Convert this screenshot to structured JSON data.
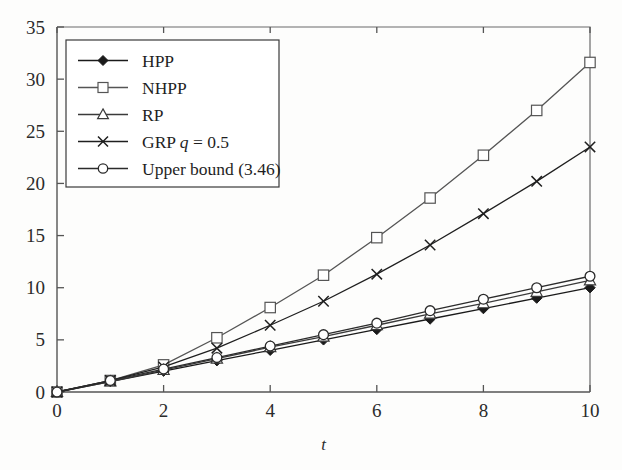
{
  "chart_data": {
    "type": "line",
    "title": "",
    "xlabel": "t",
    "ylabel": "",
    "xlim": [
      0,
      10
    ],
    "ylim": [
      0,
      35
    ],
    "xticks": [
      0,
      2,
      4,
      6,
      8,
      10
    ],
    "yticks": [
      0,
      5,
      10,
      15,
      20,
      25,
      30,
      35
    ],
    "xtick_labels": [
      "0",
      "2",
      "4",
      "6",
      "8",
      "10"
    ],
    "ytick_labels": [
      "0",
      "5",
      "10",
      "15",
      "20",
      "25",
      "30",
      "35"
    ],
    "grid": false,
    "legend_position": "upper left",
    "x": [
      0,
      1,
      2,
      3,
      4,
      5,
      6,
      7,
      8,
      9,
      10
    ],
    "series": [
      {
        "name": "HPP",
        "label": "HPP",
        "marker": "filled-diamond",
        "color": "#1a1a1a",
        "values": [
          0,
          1.0,
          2.0,
          3.0,
          4.0,
          5.0,
          6.0,
          7.0,
          8.0,
          9.0,
          10.0
        ]
      },
      {
        "name": "NHPP",
        "label": "NHPP",
        "marker": "open-square",
        "color": "#555555",
        "values": [
          0,
          1.1,
          2.6,
          5.2,
          8.1,
          11.2,
          14.8,
          18.6,
          22.7,
          27.0,
          31.6
        ]
      },
      {
        "name": "RP",
        "label": "RP",
        "marker": "open-triangle",
        "color": "#3a3a3a",
        "values": [
          0,
          1.0,
          2.1,
          3.2,
          4.3,
          5.3,
          6.4,
          7.5,
          8.5,
          9.6,
          10.7
        ]
      },
      {
        "name": "GRP q = 0.5",
        "label_prefix": "GRP ",
        "label_italic": "q",
        "label_suffix": " = 0.5",
        "marker": "x-cross",
        "color": "#1f1f1f",
        "values": [
          0,
          1.1,
          2.4,
          4.2,
          6.4,
          8.7,
          11.3,
          14.1,
          17.1,
          20.2,
          23.5
        ]
      },
      {
        "name": "Upper bound (3.46)",
        "label": "Upper bound (3.46)",
        "marker": "open-circle",
        "color": "#2b2b2b",
        "values": [
          0,
          1.1,
          2.2,
          3.3,
          4.4,
          5.5,
          6.6,
          7.8,
          8.9,
          10.0,
          11.1
        ]
      }
    ]
  },
  "legend": {
    "entries": [
      {
        "label": "HPP",
        "marker": "filled-diamond"
      },
      {
        "label": "NHPP",
        "marker": "open-square"
      },
      {
        "label": "RP",
        "marker": "open-triangle"
      },
      {
        "label": "GRP q = 0.5",
        "marker": "x-cross"
      },
      {
        "label": "Upper bound (3.46)",
        "marker": "open-circle"
      }
    ]
  }
}
